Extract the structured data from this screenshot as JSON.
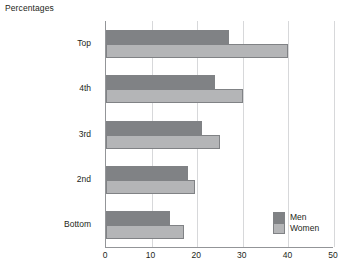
{
  "chart_data": {
    "type": "bar",
    "orientation": "horizontal",
    "title": "Percentages",
    "xlabel": "",
    "ylabel": "",
    "categories": [
      "Top",
      "4th",
      "3rd",
      "2nd",
      "Bottom"
    ],
    "series": [
      {
        "name": "Men",
        "color": "#808285",
        "values": [
          27,
          24,
          21,
          18,
          14
        ]
      },
      {
        "name": "Women",
        "color": "#b4b5b7",
        "values": [
          40,
          30,
          25,
          19.5,
          17
        ]
      }
    ],
    "xlim": [
      0,
      50
    ],
    "xticks": [
      0,
      10,
      20,
      30,
      40,
      50
    ],
    "xtick_labels": [
      "0",
      "10",
      "20",
      "30",
      "40",
      "50"
    ],
    "grid": "vertical",
    "legend_position": "bottom-right",
    "legend_entries": [
      "Men",
      "Women"
    ]
  }
}
